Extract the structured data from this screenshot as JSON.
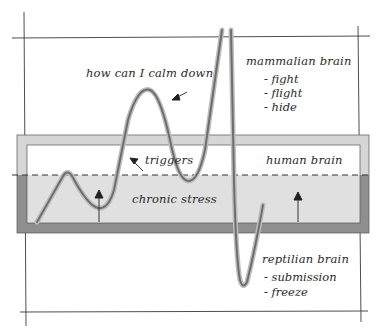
{
  "diagram": {
    "title": "",
    "colors": {
      "background": "#ffffff",
      "sketch_line": "#3a3a3a",
      "box_border_light": "#d4d4d4",
      "box_border_dark": "#8e8e8e",
      "stress_fill": "#dcdcdc",
      "curve": "#7d7d7d"
    },
    "labels": {
      "calm_question": "how can I calm down",
      "triggers": "triggers",
      "human_brain": "human brain",
      "chronic_stress": "chronic stress"
    },
    "mammalian": {
      "heading": "mammalian brain",
      "items": [
        "- fight",
        "- flight",
        "- hide"
      ]
    },
    "reptilian": {
      "heading": "reptilian brain",
      "items": [
        "- submission",
        "- freeze"
      ]
    },
    "zones": [
      {
        "name": "mammalian brain",
        "position": "top"
      },
      {
        "name": "human brain",
        "position": "middle"
      },
      {
        "name": "reptilian brain",
        "position": "bottom"
      }
    ]
  }
}
